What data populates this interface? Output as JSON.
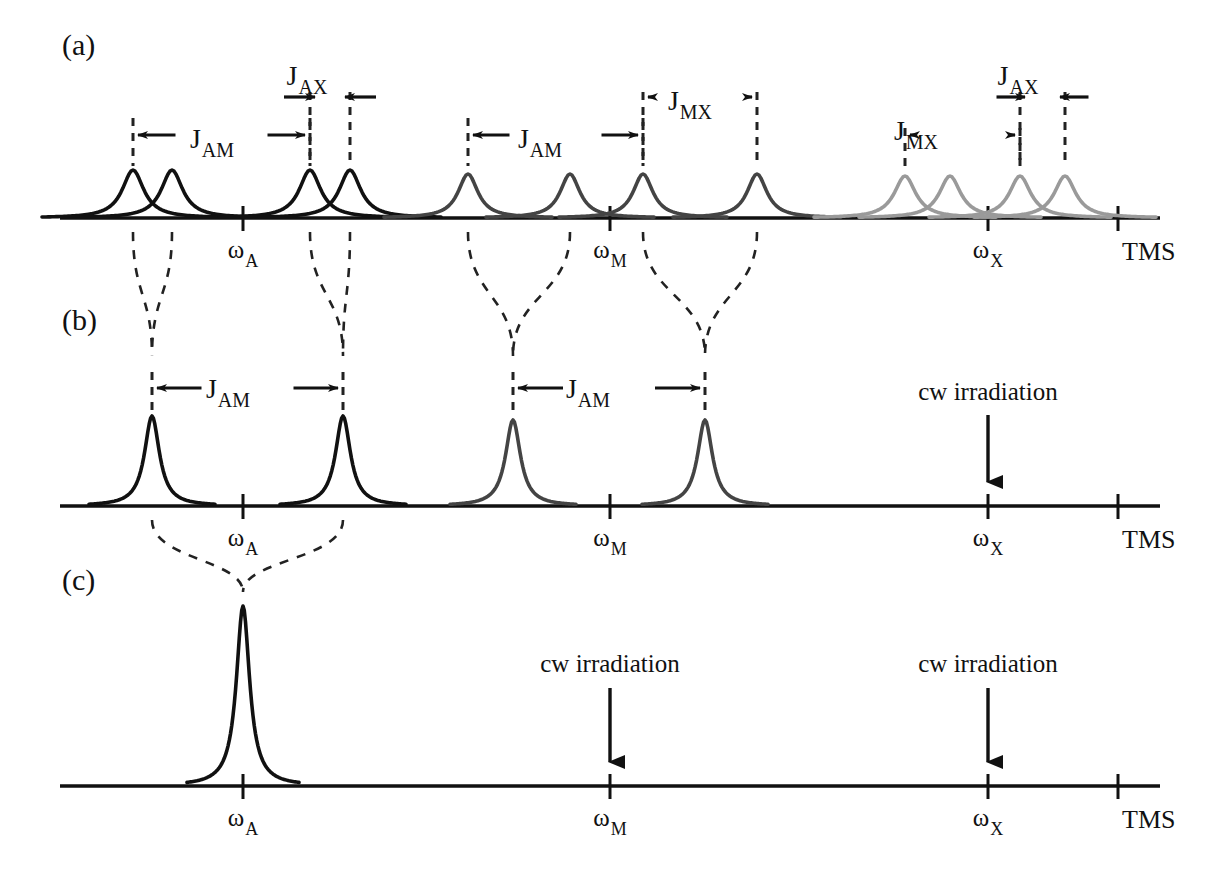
{
  "figure": {
    "width": 1220,
    "height": 882,
    "background": "#ffffff"
  },
  "colors": {
    "axis": "#111111",
    "peak_A": "#111111",
    "peak_M": "#444444",
    "peak_X": "#9a9a9a",
    "dashed": "#222222",
    "text": "#111111"
  },
  "panels": [
    {
      "id": "a",
      "label": "(a)",
      "label_x": 62,
      "label_y": 55,
      "baseline_y": 218,
      "axis_x0": 60,
      "axis_x1": 1160,
      "ticks": [
        {
          "name": "omega-A",
          "x": 243,
          "base": "ω",
          "sub": "A"
        },
        {
          "name": "omega-M",
          "x": 610,
          "base": "ω",
          "sub": "M"
        },
        {
          "name": "omega-X",
          "x": 988,
          "base": "ω",
          "sub": "X"
        },
        {
          "name": "TMS",
          "x": 1118,
          "text": "TMS"
        }
      ],
      "peaks": [
        {
          "x": 133,
          "height": 48,
          "width": 13,
          "color": "#111111",
          "group": "A"
        },
        {
          "x": 172,
          "height": 48,
          "width": 13,
          "color": "#111111",
          "group": "A"
        },
        {
          "x": 310,
          "height": 48,
          "width": 13,
          "color": "#111111",
          "group": "A"
        },
        {
          "x": 350,
          "height": 48,
          "width": 13,
          "color": "#111111",
          "group": "A"
        },
        {
          "x": 468,
          "height": 44,
          "width": 12,
          "color": "#444444",
          "group": "M"
        },
        {
          "x": 570,
          "height": 44,
          "width": 12,
          "color": "#444444",
          "group": "M"
        },
        {
          "x": 643,
          "height": 44,
          "width": 12,
          "color": "#444444",
          "group": "M"
        },
        {
          "x": 757,
          "height": 44,
          "width": 12,
          "color": "#444444",
          "group": "M"
        },
        {
          "x": 905,
          "height": 42,
          "width": 13,
          "color": "#9a9a9a",
          "group": "X"
        },
        {
          "x": 950,
          "height": 42,
          "width": 13,
          "color": "#9a9a9a",
          "group": "X"
        },
        {
          "x": 1020,
          "height": 42,
          "width": 13,
          "color": "#9a9a9a",
          "group": "X"
        },
        {
          "x": 1065,
          "height": 42,
          "width": 13,
          "color": "#9a9a9a",
          "group": "X"
        }
      ],
      "couplings": [
        {
          "name": "J-AM-left",
          "base": "J",
          "sub": "AM",
          "label_x": 212,
          "label_y": 148,
          "tier_y": 135,
          "left_x": 133,
          "right_x": 310,
          "stem_top": 118
        },
        {
          "name": "J-AX-left",
          "base": "J",
          "sub": "AX",
          "label_x": 307,
          "label_y": 85,
          "tier_y": 97,
          "left_x": 310,
          "right_x": 350,
          "stem_top": 92
        },
        {
          "name": "J-AM-right",
          "base": "J",
          "sub": "AM",
          "label_x": 540,
          "label_y": 148,
          "tier_y": 135,
          "left_x": 468,
          "right_x": 643,
          "stem_top": 118
        },
        {
          "name": "J-MX-mid",
          "base": "J",
          "sub": "MX",
          "label_x": 690,
          "label_y": 110,
          "tier_y": 97,
          "left_x": 643,
          "right_x": 757,
          "stem_top": 92
        },
        {
          "name": "J-MX-right",
          "base": "J",
          "sub": "MX",
          "label_x": 916,
          "label_y": 140,
          "tier_y": 135,
          "left_x": 905,
          "right_x": 1020,
          "stem_top": 128
        },
        {
          "name": "J-AX-right",
          "base": "J",
          "sub": "AX",
          "label_x": 1018,
          "label_y": 85,
          "tier_y": 97,
          "left_x": 1020,
          "right_x": 1065,
          "stem_top": 92
        }
      ]
    },
    {
      "id": "b",
      "label": "(b)",
      "label_x": 62,
      "label_y": 330,
      "baseline_y": 506,
      "axis_x0": 60,
      "axis_x1": 1160,
      "ticks": [
        {
          "name": "omega-A",
          "x": 243,
          "base": "ω",
          "sub": "A"
        },
        {
          "name": "omega-M",
          "x": 610,
          "base": "ω",
          "sub": "M"
        },
        {
          "name": "omega-X",
          "x": 988,
          "base": "ω",
          "sub": "X"
        },
        {
          "name": "TMS",
          "x": 1118,
          "text": "TMS"
        }
      ],
      "peaks": [
        {
          "x": 152,
          "height": 90,
          "width": 9,
          "color": "#111111",
          "group": "A"
        },
        {
          "x": 343,
          "height": 90,
          "width": 9,
          "color": "#111111",
          "group": "A"
        },
        {
          "x": 513,
          "height": 86,
          "width": 9,
          "color": "#444444",
          "group": "M"
        },
        {
          "x": 705,
          "height": 86,
          "width": 9,
          "color": "#444444",
          "group": "M"
        }
      ],
      "couplings": [
        {
          "name": "J-AM-left",
          "base": "J",
          "sub": "AM",
          "label_x": 228,
          "label_y": 398,
          "tier_y": 388,
          "left_x": 152,
          "right_x": 343,
          "stem_top": 372
        },
        {
          "name": "J-AM-right",
          "base": "J",
          "sub": "AM",
          "label_x": 588,
          "label_y": 398,
          "tier_y": 388,
          "left_x": 513,
          "right_x": 705,
          "stem_top": 372
        }
      ],
      "irradiation": [
        {
          "name": "cw-irradiation-X",
          "text": "cw irradiation",
          "text_x": 988,
          "text_y": 400,
          "arrow_x": 988,
          "arrow_y0": 415,
          "arrow_y1": 482
        }
      ]
    },
    {
      "id": "c",
      "label": "(c)",
      "label_x": 62,
      "label_y": 590,
      "baseline_y": 786,
      "axis_x0": 60,
      "axis_x1": 1160,
      "ticks": [
        {
          "name": "omega-A",
          "x": 243,
          "base": "ω",
          "sub": "A"
        },
        {
          "name": "omega-M",
          "x": 610,
          "base": "ω",
          "sub": "M"
        },
        {
          "name": "omega-X",
          "x": 988,
          "base": "ω",
          "sub": "X"
        },
        {
          "name": "TMS",
          "x": 1118,
          "text": "TMS"
        }
      ],
      "peaks": [
        {
          "x": 243,
          "height": 180,
          "width": 8,
          "color": "#111111",
          "group": "A"
        }
      ],
      "couplings": [],
      "irradiation": [
        {
          "name": "cw-irradiation-M",
          "text": "cw irradiation",
          "text_x": 610,
          "text_y": 672,
          "arrow_x": 610,
          "arrow_y0": 688,
          "arrow_y1": 762
        },
        {
          "name": "cw-irradiation-X",
          "text": "cw irradiation",
          "text_x": 988,
          "text_y": 672,
          "arrow_x": 988,
          "arrow_y0": 688,
          "arrow_y1": 762
        }
      ]
    }
  ],
  "correlations_a_to_b": [
    {
      "name": "merge-A1",
      "from_left": 133,
      "from_right": 172,
      "to_x": 152,
      "top_y": 232,
      "bottom_y": 372
    },
    {
      "name": "merge-A2",
      "from_left": 310,
      "from_right": 350,
      "to_x": 343,
      "top_y": 232,
      "bottom_y": 372
    },
    {
      "name": "merge-M1",
      "from_left": 468,
      "from_right": 570,
      "to_x": 513,
      "top_y": 232,
      "bottom_y": 372
    },
    {
      "name": "merge-M2",
      "from_left": 643,
      "from_right": 757,
      "to_x": 705,
      "top_y": 232,
      "bottom_y": 372
    }
  ],
  "correlations_b_to_c": [
    {
      "name": "merge-A-final",
      "from_left": 152,
      "from_right": 343,
      "to_x": 243,
      "top_y": 520,
      "bottom_y": 608
    }
  ],
  "legend_notes": {
    "axis_label_right": "TMS",
    "irradiation_label": "cw irradiation",
    "j_labels": [
      "J_AM",
      "J_AX",
      "J_MX"
    ],
    "frequency_labels": [
      "ω_A",
      "ω_M",
      "ω_X"
    ]
  },
  "chart_data": {
    "type": "line",
    "xlabel": "",
    "ylabel": "",
    "grid": false,
    "legend_position": "none",
    "axis_note": "chemical shift axis increasing to the right toward TMS",
    "tick_labels": [
      "ω_A",
      "ω_M",
      "ω_X",
      "TMS"
    ],
    "tick_positions_px": [
      243,
      610,
      988,
      1118
    ],
    "subplots": [
      {
        "panel": "a",
        "caption": "(a)",
        "description": "Fully coupled AMX spectrum: A and M appear as doublets of doublets (4 lines each); X appears as a doublet of doublets (4 lines)",
        "series": [
          {
            "name": "A multiplet",
            "color": "#111111",
            "positions_px": [
              133,
              172,
              310,
              350
            ],
            "relative_intensity": [
              1,
              1,
              1,
              1
            ]
          },
          {
            "name": "M multiplet",
            "color": "#444444",
            "positions_px": [
              468,
              570,
              643,
              757
            ],
            "relative_intensity": [
              1,
              1,
              1,
              1
            ]
          },
          {
            "name": "X multiplet",
            "color": "#9a9a9a",
            "positions_px": [
              905,
              950,
              1020,
              1065
            ],
            "relative_intensity": [
              1,
              1,
              1,
              1
            ]
          }
        ],
        "annotations": [
          "J_AM",
          "J_AX",
          "J_AM",
          "J_MX",
          "J_MX",
          "J_AX"
        ]
      },
      {
        "panel": "b",
        "caption": "(b)",
        "description": "X irradiated: A and M collapse to doublets split only by J_AM; X resonance removed",
        "series": [
          {
            "name": "A doublet",
            "color": "#111111",
            "positions_px": [
              152,
              343
            ],
            "relative_intensity": [
              1,
              1
            ]
          },
          {
            "name": "M doublet",
            "color": "#444444",
            "positions_px": [
              513,
              705
            ],
            "relative_intensity": [
              1,
              1
            ]
          }
        ],
        "annotations": [
          "J_AM",
          "J_AM",
          "cw irradiation at ω_X"
        ]
      },
      {
        "panel": "c",
        "caption": "(c)",
        "description": "Both M and X irradiated: A collapses to a single sharp singlet",
        "series": [
          {
            "name": "A singlet",
            "color": "#111111",
            "positions_px": [
              243
            ],
            "relative_intensity": [
              1
            ]
          }
        ],
        "annotations": [
          "cw irradiation at ω_M",
          "cw irradiation at ω_X"
        ]
      }
    ]
  }
}
